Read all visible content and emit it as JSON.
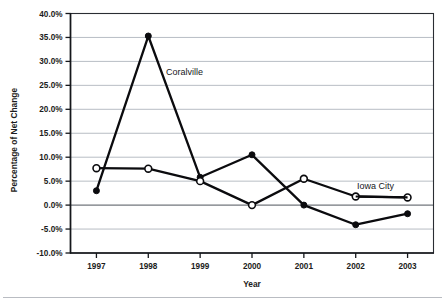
{
  "chart_data": {
    "type": "line",
    "title": "",
    "xlabel": "Year",
    "ylabel": "Percentage of Net Change",
    "categories": [
      "1997",
      "1998",
      "1999",
      "2000",
      "2001",
      "2002",
      "2003"
    ],
    "x": [
      1997,
      1998,
      1999,
      2000,
      2001,
      2002,
      2003
    ],
    "ylim": [
      -10.0,
      40.0
    ],
    "ytick_values": [
      40.0,
      35.0,
      30.0,
      25.0,
      20.0,
      15.0,
      10.0,
      5.0,
      0.0,
      -5.0,
      -10.0
    ],
    "ytick_labels": [
      "40.0%",
      "35.0%",
      "30.0%",
      "25.0%",
      "20.0%",
      "15.0%",
      "10.0%",
      "5.0%",
      "0.0%",
      "-5.0%",
      "-10.0%"
    ],
    "grid": true,
    "grid_axis": "y",
    "legend": "inline-annotations",
    "series": [
      {
        "name": "Coralville",
        "marker": "filled-circle",
        "values": [
          3.0,
          35.3,
          5.8,
          10.5,
          0.0,
          -4.1,
          -1.8
        ],
        "annotation": "Coralville",
        "annotation_at": 1998
      },
      {
        "name": "Iowa City",
        "marker": "open-circle",
        "values": [
          7.7,
          7.6,
          5.0,
          0.0,
          5.5,
          1.8,
          1.6
        ],
        "annotation": "Iowa City",
        "annotation_at": 2002
      }
    ]
  },
  "axes": {
    "ylabel": "Percentage of Net Change",
    "xlabel": "Year",
    "ytick_labels": [
      "40.0%",
      "35.0%",
      "30.0%",
      "25.0%",
      "20.0%",
      "15.0%",
      "10.0%",
      "5.0%",
      "0.0%",
      "-5.0%",
      "-10.0%"
    ],
    "xtick_labels": [
      "1997",
      "1998",
      "1999",
      "2000",
      "2001",
      "2002",
      "2003"
    ]
  },
  "annotations": {
    "coralville": "Coralville",
    "iowa_city": "Iowa City"
  }
}
